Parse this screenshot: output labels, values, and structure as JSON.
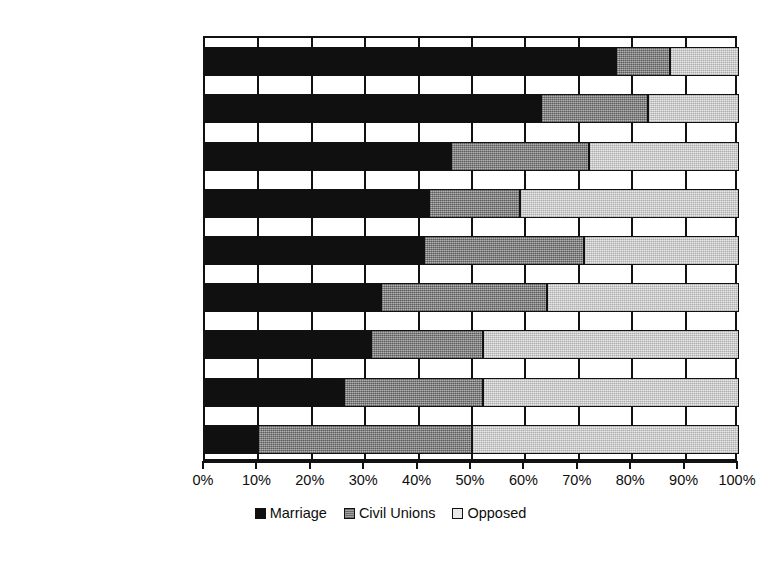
{
  "chart_data": {
    "type": "bar",
    "orientation": "horizontal",
    "stacked": true,
    "title": "",
    "subtitle": "",
    "xlabel": "",
    "ylabel": "",
    "xlim": [
      0,
      100
    ],
    "grid": true,
    "grid_axis": "x",
    "legend_position": "bottom-center",
    "categories": [
      "Jews",
      "Seculars",
      "Hispanic Catholics",
      "Hispanic Protestants",
      "Catholics",
      "Mainline Protestants",
      "Black Protestants",
      "Evangelical Protestants",
      "Latter-Day Saints"
    ],
    "series": [
      {
        "name": "Marriage",
        "color": "#101010",
        "values": [
          77,
          63,
          46,
          42,
          41,
          33,
          31,
          26,
          10
        ]
      },
      {
        "name": "Civil Unions",
        "color": "#8e8e8e",
        "values": [
          10,
          20,
          26,
          17,
          30,
          31,
          21,
          26,
          40
        ]
      },
      {
        "name": "Opposed",
        "color": "#d6d6d6",
        "values": [
          13,
          17,
          28,
          41,
          29,
          36,
          48,
          48,
          50
        ]
      }
    ],
    "xticks": [
      0,
      10,
      20,
      30,
      40,
      50,
      60,
      70,
      80,
      90,
      100
    ],
    "xtick_labels": [
      "0%",
      "10%",
      "20%",
      "30%",
      "40%",
      "50%",
      "60%",
      "70%",
      "80%",
      "90%",
      "100%"
    ]
  },
  "legend": {
    "items": [
      {
        "label": "Marriage"
      },
      {
        "label": "Civil Unions"
      },
      {
        "label": "Opposed"
      }
    ]
  },
  "caption": {
    "text": ""
  }
}
